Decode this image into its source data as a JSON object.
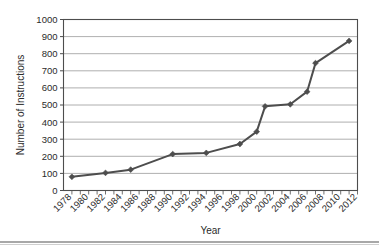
{
  "chart_data": {
    "type": "line",
    "title": "",
    "xlabel": "Year",
    "ylabel": "Number of Instructions",
    "xlim": [
      1977,
      2012
    ],
    "ylim": [
      0,
      1000
    ],
    "ytick_step": 100,
    "grid": "horizontal",
    "legend": "none",
    "marker": "diamond",
    "line_color": "#4d4d4d",
    "x": [
      1978,
      1982,
      1985,
      1990,
      1994,
      1998,
      2000,
      2001,
      2004,
      2006,
      2007,
      2011
    ],
    "values": [
      80,
      103,
      122,
      213,
      220,
      272,
      344,
      492,
      504,
      578,
      745,
      875
    ],
    "yticks": [
      0,
      100,
      200,
      300,
      400,
      500,
      600,
      700,
      800,
      900,
      1000
    ],
    "xticks": [
      1978,
      1980,
      1982,
      1984,
      1986,
      1988,
      1990,
      1992,
      1994,
      1996,
      1998,
      2000,
      2002,
      2004,
      2006,
      2008,
      2010,
      2012
    ],
    "xticks_minor_step": 1
  },
  "axes": {
    "y_label": "Number of Instructions",
    "x_label": "Year"
  },
  "colors": {
    "line": "#4d4d4d",
    "grid": "#9a9a9a",
    "axis": "#4d4d4d",
    "text": "#2b2b2b",
    "background": "#ffffff"
  }
}
